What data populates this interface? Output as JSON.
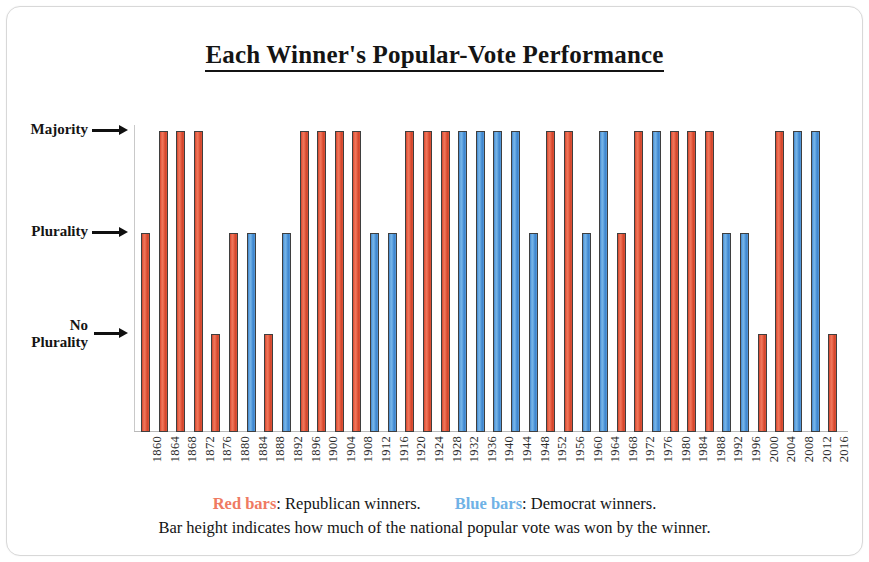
{
  "title": "Each Winner's Popular-Vote Performance",
  "y_axis": {
    "labels": [
      {
        "id": "majority",
        "text": "Majority",
        "two_line": false
      },
      {
        "id": "plurality",
        "text": "Plurality",
        "two_line": false
      },
      {
        "id": "no-plurality",
        "line1": "No",
        "line2": "Plurality",
        "two_line": true
      }
    ]
  },
  "footer": {
    "red_swatch": "Red bars",
    "red_text": ": Republican winners.",
    "blue_swatch": "Blue bars",
    "blue_text": ":  Democrat winners.",
    "note": "Bar height indicates how much of the national popular vote was won by the winner."
  },
  "colors": {
    "republican": "#e05538",
    "democrat": "#5ba0dd",
    "republican_legend": "#ef7a62",
    "democrat_legend": "#6fb2e6",
    "bar_outline": "#3f3f3f",
    "axis": "#b9b9b9",
    "frame": "#d8d8d8",
    "text": "#141414"
  },
  "chart_data": {
    "type": "bar",
    "title": "Each Winner's Popular-Vote Performance",
    "xlabel": "",
    "ylabel": "",
    "grid": false,
    "legend_position": "bottom",
    "y_categories": [
      "No Plurality",
      "Plurality",
      "Majority"
    ],
    "y_levels": {
      "No Plurality": 1,
      "Plurality": 2,
      "Majority": 3
    },
    "ylim": [
      0,
      3
    ],
    "legend": [
      {
        "name": "Red bars",
        "meaning": "Republican winners.",
        "color": "#e05538"
      },
      {
        "name": "Blue bars",
        "meaning": "Democrat winners.",
        "color": "#5ba0dd"
      }
    ],
    "annotations": [
      "Bar height indicates how much of the national popular vote was won by the winner."
    ],
    "categories": [
      "1860",
      "1864",
      "1868",
      "1872",
      "1876",
      "1880",
      "1884",
      "1888",
      "1892",
      "1896",
      "1900",
      "1904",
      "1908",
      "1912",
      "1916",
      "1920",
      "1924",
      "1928",
      "1932",
      "1936",
      "1940",
      "1944",
      "1948",
      "1952",
      "1956",
      "1960",
      "1964",
      "1968",
      "1972",
      "1976",
      "1980",
      "1984",
      "1988",
      "1992",
      "1996",
      "2000",
      "2004",
      "2008",
      "2012",
      "2016"
    ],
    "values": [
      2,
      3,
      3,
      3,
      1,
      2,
      2,
      1,
      2,
      3,
      3,
      3,
      3,
      2,
      2,
      3,
      3,
      3,
      3,
      3,
      3,
      3,
      2,
      3,
      3,
      2,
      3,
      2,
      3,
      3,
      3,
      3,
      3,
      2,
      2,
      1,
      3,
      3,
      3,
      1
    ],
    "value_labels": [
      "Plurality",
      "Majority",
      "Majority",
      "Majority",
      "No Plurality",
      "Plurality",
      "Plurality",
      "No Plurality",
      "Plurality",
      "Majority",
      "Majority",
      "Majority",
      "Majority",
      "Plurality",
      "Plurality",
      "Majority",
      "Majority",
      "Majority",
      "Majority",
      "Majority",
      "Majority",
      "Majority",
      "Plurality",
      "Majority",
      "Majority",
      "Plurality",
      "Majority",
      "Plurality",
      "Majority",
      "Majority",
      "Majority",
      "Majority",
      "Majority",
      "Plurality",
      "Plurality",
      "No Plurality",
      "Majority",
      "Majority",
      "Majority",
      "No Plurality"
    ],
    "party": [
      "Republican",
      "Republican",
      "Republican",
      "Republican",
      "Republican",
      "Republican",
      "Democrat",
      "Republican",
      "Democrat",
      "Republican",
      "Republican",
      "Republican",
      "Republican",
      "Democrat",
      "Democrat",
      "Republican",
      "Republican",
      "Republican",
      "Democrat",
      "Democrat",
      "Democrat",
      "Democrat",
      "Democrat",
      "Republican",
      "Republican",
      "Democrat",
      "Democrat",
      "Republican",
      "Republican",
      "Democrat",
      "Republican",
      "Republican",
      "Republican",
      "Democrat",
      "Democrat",
      "Republican",
      "Republican",
      "Democrat",
      "Democrat",
      "Republican"
    ]
  }
}
